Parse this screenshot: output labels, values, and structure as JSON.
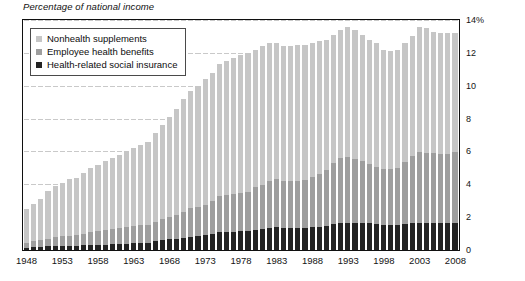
{
  "title": "Percentage of national income",
  "legend": {
    "items": [
      {
        "label": "Nonhealth supplements",
        "color": "#c6c6c6",
        "swatch": "light-gray-square"
      },
      {
        "label": "Employee health benefits",
        "color": "#9e9e9e",
        "swatch": "medium-gray-square"
      },
      {
        "label": "Health-related social insurance",
        "color": "#232323",
        "swatch": "black-square"
      }
    ]
  },
  "chart_data": {
    "type": "bar",
    "stacked": true,
    "title": "Percentage of national income",
    "xlabel": "",
    "ylabel": "Percentage of national income",
    "ylim": [
      0,
      14
    ],
    "yticks": [
      0,
      2,
      4,
      6,
      8,
      10,
      12,
      14
    ],
    "ytick_labels": [
      "0",
      "2",
      "4",
      "6",
      "8",
      "10",
      "12",
      "14%"
    ],
    "ytick_suffix_top": "%",
    "grid": true,
    "grid_axis": "y",
    "legend_position": "top-left",
    "axis_side": "right",
    "xticks": [
      1948,
      1953,
      1958,
      1963,
      1968,
      1973,
      1978,
      1983,
      1988,
      1993,
      1998,
      2003,
      2008
    ],
    "categories": [
      1948,
      1949,
      1950,
      1951,
      1952,
      1953,
      1954,
      1955,
      1956,
      1957,
      1958,
      1959,
      1960,
      1961,
      1962,
      1963,
      1964,
      1965,
      1966,
      1967,
      1968,
      1969,
      1970,
      1971,
      1972,
      1973,
      1974,
      1975,
      1976,
      1977,
      1978,
      1979,
      1980,
      1981,
      1982,
      1983,
      1984,
      1985,
      1986,
      1987,
      1988,
      1989,
      1990,
      1991,
      1992,
      1993,
      1994,
      1995,
      1996,
      1997,
      1998,
      1999,
      2000,
      2001,
      2002,
      2003,
      2004,
      2005,
      2006,
      2007,
      2008
    ],
    "series": [
      {
        "name": "Health-related social insurance",
        "color": "#232323",
        "values": [
          0.15,
          0.16,
          0.18,
          0.22,
          0.24,
          0.25,
          0.26,
          0.27,
          0.28,
          0.3,
          0.32,
          0.33,
          0.35,
          0.36,
          0.38,
          0.4,
          0.42,
          0.43,
          0.52,
          0.62,
          0.66,
          0.7,
          0.74,
          0.8,
          0.84,
          0.92,
          0.98,
          1.08,
          1.1,
          1.12,
          1.14,
          1.16,
          1.24,
          1.3,
          1.36,
          1.38,
          1.34,
          1.34,
          1.36,
          1.36,
          1.38,
          1.42,
          1.46,
          1.56,
          1.62,
          1.66,
          1.64,
          1.64,
          1.62,
          1.58,
          1.52,
          1.5,
          1.5,
          1.56,
          1.62,
          1.66,
          1.62,
          1.62,
          1.62,
          1.64,
          1.66
        ]
      },
      {
        "name": "Employee health benefits",
        "color": "#9e9e9e",
        "values": [
          0.3,
          0.36,
          0.42,
          0.48,
          0.54,
          0.58,
          0.62,
          0.66,
          0.72,
          0.78,
          0.84,
          0.88,
          0.92,
          0.96,
          1.0,
          1.04,
          1.08,
          1.12,
          1.16,
          1.24,
          1.34,
          1.44,
          1.6,
          1.74,
          1.8,
          1.84,
          2.0,
          2.22,
          2.26,
          2.3,
          2.32,
          2.38,
          2.6,
          2.66,
          2.86,
          2.96,
          2.88,
          2.84,
          2.86,
          2.92,
          3.06,
          3.22,
          3.44,
          3.76,
          3.96,
          4.0,
          3.9,
          3.76,
          3.62,
          3.48,
          3.4,
          3.42,
          3.52,
          3.82,
          4.12,
          4.3,
          4.26,
          4.26,
          4.2,
          4.22,
          4.3
        ]
      },
      {
        "name": "Nonhealth supplements",
        "color": "#c6c6c6",
        "values": [
          2.05,
          2.28,
          2.5,
          2.9,
          3.12,
          3.27,
          3.42,
          3.47,
          3.7,
          3.92,
          4.04,
          4.19,
          4.33,
          4.48,
          4.62,
          4.76,
          4.9,
          5.05,
          5.42,
          5.74,
          6.1,
          6.46,
          6.86,
          7.16,
          7.36,
          7.64,
          7.82,
          8.0,
          8.14,
          8.28,
          8.44,
          8.46,
          8.36,
          8.44,
          8.38,
          8.26,
          8.18,
          8.22,
          8.28,
          8.22,
          8.16,
          8.06,
          7.9,
          7.78,
          7.82,
          7.94,
          7.86,
          7.7,
          7.56,
          7.54,
          7.28,
          7.18,
          7.18,
          7.22,
          7.26,
          7.64,
          7.62,
          7.42,
          7.38,
          7.34,
          7.24
        ]
      }
    ],
    "totals": [
      2.5,
      2.8,
      3.1,
      3.6,
      3.9,
      4.1,
      4.3,
      4.4,
      4.7,
      5.0,
      5.2,
      5.4,
      5.6,
      5.8,
      6.0,
      6.2,
      6.4,
      6.6,
      7.1,
      7.6,
      8.1,
      8.6,
      9.2,
      9.7,
      10.0,
      10.4,
      10.8,
      11.3,
      11.5,
      11.7,
      11.9,
      12.0,
      12.2,
      12.4,
      12.6,
      12.6,
      12.4,
      12.4,
      12.5,
      12.5,
      12.6,
      12.7,
      12.8,
      13.1,
      13.4,
      13.6,
      13.4,
      13.1,
      12.8,
      12.6,
      12.2,
      12.1,
      12.2,
      12.6,
      13.0,
      13.6,
      13.5,
      13.3,
      13.2,
      13.2,
      13.2
    ]
  }
}
